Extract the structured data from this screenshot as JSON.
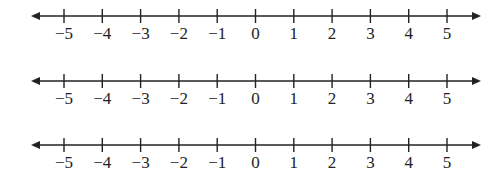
{
  "diagram": {
    "type": "number-lines",
    "count": 3,
    "line_color": "#222222",
    "label_color": "#222222",
    "lines": [
      {
        "id": "line-1",
        "y": 16,
        "arrows": "both",
        "ticks": [
          -5,
          -4,
          -3,
          -2,
          -1,
          0,
          1,
          2,
          3,
          4,
          5
        ],
        "labels": [
          "−5",
          "−4",
          "−3",
          "−2",
          "−1",
          "0",
          "1",
          "2",
          "3",
          "4",
          "5"
        ]
      },
      {
        "id": "line-2",
        "y": 81,
        "arrows": "both",
        "ticks": [
          -5,
          -4,
          -3,
          -2,
          -1,
          0,
          1,
          2,
          3,
          4,
          5
        ],
        "labels": [
          "−5",
          "−4",
          "−3",
          "−2",
          "−1",
          "0",
          "1",
          "2",
          "3",
          "4",
          "5"
        ]
      },
      {
        "id": "line-3",
        "y": 145,
        "arrows": "both",
        "ticks": [
          -5,
          -4,
          -3,
          -2,
          -1,
          0,
          1,
          2,
          3,
          4,
          5
        ],
        "labels": [
          "−5",
          "−4",
          "−3",
          "−2",
          "−1",
          "0",
          "1",
          "2",
          "3",
          "4",
          "5"
        ]
      }
    ],
    "geometry": {
      "x_start": 31,
      "x_end": 481,
      "tick_x0": 64,
      "tick_spacing": 38.3,
      "tick_half_height": 7,
      "label_offset": 17
    }
  }
}
